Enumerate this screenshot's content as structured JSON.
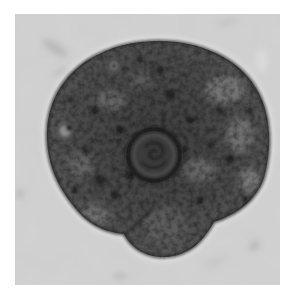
{
  "image": {
    "subject": "amoeba-like cell micrograph",
    "style": "grayscale bright-field microscopy",
    "colors": {
      "border": "#ffffff",
      "background_field": "#d2d2d2",
      "cell_body": "#4a4a4a",
      "cell_membrane": "#1e1e1e",
      "nucleus_ring": "#151515",
      "vacuole_light": "#8a8a8a"
    },
    "features": {
      "nucleus": {
        "cx": 154,
        "cy": 155,
        "r": 27
      },
      "ring_vacuoles": [
        {
          "cx": 114,
          "cy": 66,
          "r": 7
        },
        {
          "cx": 67,
          "cy": 130,
          "r": 8
        }
      ],
      "bottom_lobe": {
        "cx": 163,
        "cy": 225,
        "rx": 36,
        "ry": 32
      }
    }
  }
}
